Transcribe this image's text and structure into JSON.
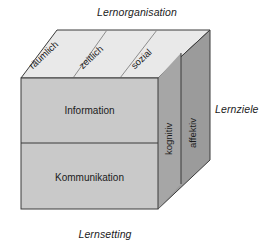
{
  "diagram": {
    "title_top": "Lernorganisation",
    "title_bottom": "Lernsetting",
    "title_right": "Lernziele",
    "front_face": {
      "sections": [
        {
          "label": "Information"
        },
        {
          "label": "Kommunikation"
        }
      ]
    },
    "top_face": {
      "sections": [
        {
          "label": "räumlich"
        },
        {
          "label": "zeitlich"
        },
        {
          "label": "sozial"
        }
      ]
    },
    "right_face": {
      "sections": [
        {
          "label": "kognitiv"
        },
        {
          "label": "affektiv"
        }
      ]
    },
    "colors": {
      "front_face": "#c9c9c9",
      "top_face": "#e9e9e9",
      "right_face": "#9b9b9b",
      "right_face_light": "#a8a8a8",
      "outline": "#3a3a3a",
      "text": "#1b1b1b",
      "background": "#ffffff"
    }
  }
}
